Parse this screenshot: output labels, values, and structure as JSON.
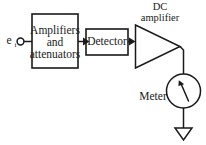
{
  "diagram": {
    "background_color": "#ffffff",
    "line_color": "#1a1a1a",
    "input": {
      "symbol_base": "e",
      "symbol_subscript": "i",
      "terminal": "open-circle"
    },
    "blocks": {
      "amplifiers": {
        "line1": "Amplifiers",
        "line2": "and",
        "line3": "attenuators"
      },
      "detector": {
        "label": "Detector"
      },
      "dc_amplifier": {
        "line1": "DC",
        "line2": "amplifier",
        "shape": "triangle"
      },
      "meter": {
        "label": "Meter",
        "shape": "circle-with-needle"
      },
      "ground": {
        "label": "",
        "shape": "open-triangle-down"
      }
    },
    "signal_flow": [
      "input",
      "amplifiers",
      "detector",
      "dc_amplifier",
      "meter",
      "ground"
    ]
  }
}
